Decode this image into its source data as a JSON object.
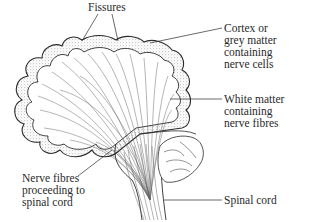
{
  "diagram": {
    "labels": {
      "fissures": [
        "Fissures"
      ],
      "cortex": [
        "Cortex or",
        "grey matter",
        "containing",
        "nerve cells"
      ],
      "white_matter": [
        "White matter",
        "containing",
        "nerve fibres"
      ],
      "nerve_fibres": [
        "Nerve fibres",
        "proceeding to",
        "spinal cord"
      ],
      "spinal_cord": [
        "Spinal cord"
      ]
    },
    "colors": {
      "ink": "#2a2a2a",
      "cortex_stipple": "#555555",
      "fibre_lines": "#6a6a6a",
      "background": "#ffffff"
    }
  }
}
